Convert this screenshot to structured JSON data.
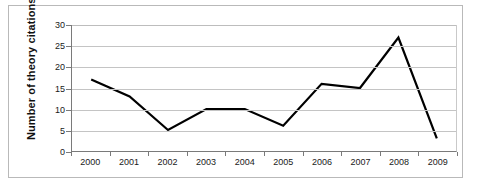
{
  "chart_data": {
    "type": "line",
    "title": "",
    "xlabel": "",
    "ylabel": "Number of theory citations",
    "categories": [
      "2000",
      "2001",
      "2002",
      "2003",
      "2004",
      "2005",
      "2006",
      "2007",
      "2008",
      "2009"
    ],
    "values": [
      17,
      13,
      5,
      10,
      10,
      6,
      16,
      15,
      27,
      3
    ],
    "series": [
      {
        "name": "Number of theory citations",
        "values": [
          17,
          13,
          5,
          10,
          10,
          6,
          16,
          15,
          27,
          3
        ]
      }
    ],
    "ylim": [
      0,
      30
    ],
    "y_ticks": [
      0,
      5,
      10,
      15,
      20,
      25,
      30
    ],
    "y_tick_labels": [
      "0",
      "5",
      "10",
      "15",
      "20",
      "25",
      "30"
    ],
    "x_tick_labels": [
      "2000",
      "2001",
      "2002",
      "2003",
      "2004",
      "2005",
      "2006",
      "2007",
      "2008",
      "2009"
    ],
    "grid": "horizontal",
    "legend": "none",
    "markers": "none",
    "line_color": "#000000",
    "gridline_color": "#c4c4c4",
    "axis_color": "#7a7a7a",
    "plot_background": "#ffffff",
    "frame_color": "#b9b9b9"
  }
}
